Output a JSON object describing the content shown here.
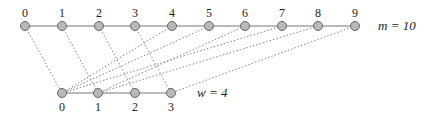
{
  "top_row": {
    "label": "m = 10",
    "nodes": [
      "0",
      "1",
      "2",
      "3",
      "4",
      "5",
      "6",
      "7",
      "8",
      "9"
    ],
    "x": [
      25,
      62,
      99,
      135,
      172,
      209,
      245,
      282,
      318,
      355
    ],
    "y": 26
  },
  "bottom_row": {
    "label": "w = 4",
    "nodes": [
      "0",
      "1",
      "2",
      "3"
    ],
    "x": [
      62,
      98,
      135,
      171
    ],
    "y": 93
  },
  "edges": [
    [
      0,
      0
    ],
    [
      1,
      1
    ],
    [
      2,
      2
    ],
    [
      3,
      3
    ],
    [
      4,
      0
    ],
    [
      5,
      0
    ],
    [
      6,
      1
    ],
    [
      7,
      0
    ],
    [
      8,
      1
    ],
    [
      9,
      3
    ]
  ],
  "colors": {
    "node_fill": "#b9b9b9",
    "node_stroke": "#666666",
    "line": "#777777",
    "dash": "#888888"
  }
}
